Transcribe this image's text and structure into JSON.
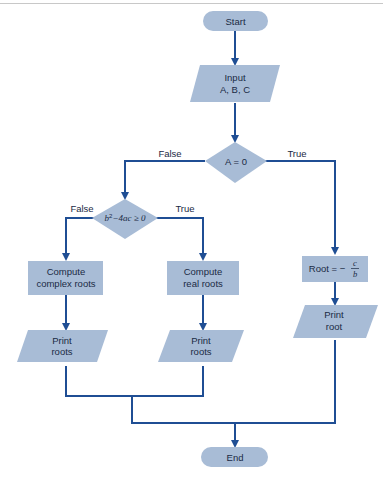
{
  "diagram": {
    "type": "flowchart",
    "colors": {
      "shape_fill": "#a8bcd6",
      "edge": "#1f4e94",
      "text": "#1a2a44"
    },
    "nodes": {
      "start": {
        "shape": "terminal",
        "label": "Start"
      },
      "input": {
        "shape": "parallelogram",
        "line1": "Input",
        "line2": "A, B, C"
      },
      "decision_a": {
        "shape": "diamond",
        "label": "A = 0"
      },
      "decision_disc": {
        "shape": "diamond",
        "label_b": "b",
        "label_sup": "2",
        "label_rest": "−4ac ≥ 0"
      },
      "root_linear": {
        "shape": "rectangle",
        "label_prefix": "Root = −",
        "numerator": "c",
        "denominator": "b"
      },
      "compute_complex": {
        "shape": "rectangle",
        "line1": "Compute",
        "line2": "complex roots"
      },
      "compute_real": {
        "shape": "rectangle",
        "line1": "Compute",
        "line2": "real roots"
      },
      "print_complex": {
        "shape": "parallelogram",
        "line1": "Print",
        "line2": "roots"
      },
      "print_real": {
        "shape": "parallelogram",
        "line1": "Print",
        "line2": "roots"
      },
      "print_root": {
        "shape": "parallelogram",
        "line1": "Print",
        "line2": "root"
      },
      "end": {
        "shape": "terminal",
        "label": "End"
      }
    },
    "edge_labels": {
      "a_false": "False",
      "a_true": "True",
      "disc_false": "False",
      "disc_true": "True"
    }
  }
}
